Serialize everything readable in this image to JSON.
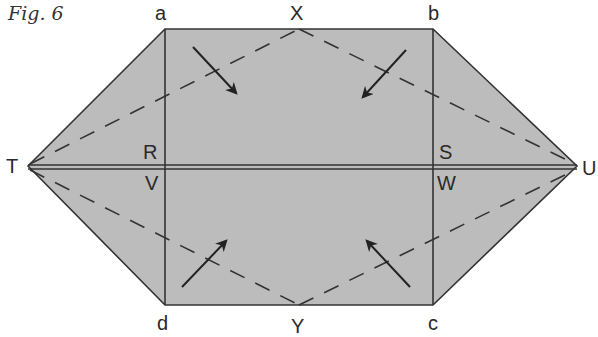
{
  "caption": "Fig. 6",
  "colors": {
    "fill": "#bcbcbc",
    "stroke": "#333333",
    "background": "#ffffff"
  },
  "labels": {
    "a": "a",
    "b": "b",
    "c": "c",
    "d": "d",
    "X": "X",
    "Y": "Y",
    "T": "T",
    "U": "U",
    "R": "R",
    "S": "S",
    "V": "V",
    "W": "W"
  },
  "fold_lines": {
    "dashed": [
      "T-X",
      "X-U",
      "T-Y",
      "Y-U"
    ],
    "solid": [
      "a-d",
      "b-c",
      "T-U"
    ]
  },
  "arrows": [
    {
      "name": "arrow-top-left",
      "direction": "down-right"
    },
    {
      "name": "arrow-top-right",
      "direction": "down-left"
    },
    {
      "name": "arrow-bottom-left",
      "direction": "up-right"
    },
    {
      "name": "arrow-bottom-right",
      "direction": "up-left"
    }
  ]
}
